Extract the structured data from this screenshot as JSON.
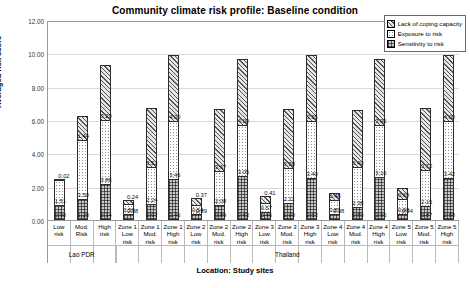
{
  "chart_data": {
    "type": "bar",
    "stacked": true,
    "title": "Community climate risk profile: Baseline condition",
    "xlabel": "Location: Study sites",
    "ylabel": "Averaged risk score",
    "ylim": [
      0,
      12
    ],
    "yticks": [
      "0.00",
      "2.00",
      "4.00",
      "6.00",
      "8.00",
      "10.00",
      "12.00"
    ],
    "ytick_values": [
      0,
      2,
      4,
      6,
      8,
      10,
      12
    ],
    "grid": true,
    "legend_position": "top-right",
    "legend": [
      {
        "label": "Lack of coping capacity",
        "pattern": "diagonal-hatch"
      },
      {
        "label": "Exposure to risk",
        "pattern": "light-dots"
      },
      {
        "label": "Sensitivity to risk",
        "pattern": "dark-checker"
      }
    ],
    "categories": [
      {
        "zone": "",
        "risk": "Low risk",
        "country": "Lao PDR"
      },
      {
        "zone": "",
        "risk": "Mod. Risk",
        "country": "Lao PDR"
      },
      {
        "zone": "",
        "risk": "High risk",
        "country": "Lao PDR"
      },
      {
        "zone": "Zone 1",
        "risk": "Low risk",
        "country": "Thailand"
      },
      {
        "zone": "Zone 1",
        "risk": "Mod. risk",
        "country": "Thailand"
      },
      {
        "zone": "Zone 1",
        "risk": "High risk",
        "country": "Thailand"
      },
      {
        "zone": "Zone 2",
        "risk": "Low risk",
        "country": "Thailand"
      },
      {
        "zone": "Zone 2",
        "risk": "Mod. risk",
        "country": "Thailand"
      },
      {
        "zone": "Zone 2",
        "risk": "High risk",
        "country": "Thailand"
      },
      {
        "zone": "Zone 3",
        "risk": "Low risk",
        "country": "Thailand"
      },
      {
        "zone": "Zone 3",
        "risk": "Mod. risk",
        "country": "Thailand"
      },
      {
        "zone": "Zone 3",
        "risk": "High risk",
        "country": "Thailand"
      },
      {
        "zone": "Zone 4",
        "risk": "Low risk",
        "country": "Thailand"
      },
      {
        "zone": "Zone 4",
        "risk": "Mod. risk",
        "country": "Thailand"
      },
      {
        "zone": "Zone 4",
        "risk": "High risk",
        "country": "Thailand"
      },
      {
        "zone": "Zone 5",
        "risk": "Low risk",
        "country": "Thailand"
      },
      {
        "zone": "Zone 5",
        "risk": "Mod. risk",
        "country": "Thailand"
      },
      {
        "zone": "Zone 5",
        "risk": "High risk",
        "country": "Thailand"
      }
    ],
    "series": [
      {
        "name": "Sensitivity to risk",
        "pattern": "dark-checker",
        "values": [
          0.9,
          1.28,
          2.14,
          0.38,
          0.97,
          2.46,
          0.39,
          0.89,
          2.63,
          0.46,
          1.0,
          2.53,
          0.38,
          0.8,
          2.56,
          0.34,
          0.87,
          2.5
        ]
      },
      {
        "name": "Exposure to risk",
        "pattern": "light-dots",
        "values": [
          1.51,
          3.5,
          3.86,
          0.56,
          2.24,
          3.46,
          0.54,
          2.08,
          3.05,
          0.57,
          2.11,
          3.4,
          0.81,
          2.38,
          3.16,
          0.9,
          2.15,
          3.42
        ]
      },
      {
        "name": "Lack of coping capacity",
        "pattern": "diagonal-hatch",
        "values": [
          0.02,
          1.44,
          3.29,
          0.24,
          3.53,
          4.0,
          0.37,
          3.67,
          4.0,
          0.41,
          3.58,
          3.95,
          0.46,
          3.4,
          3.96,
          0.69,
          3.72,
          4.0
        ]
      }
    ],
    "labels": {
      "sensitivity": [
        "0.90",
        "1.28",
        "2.14",
        "0.38",
        "0.97",
        "2.46",
        "0.39",
        "0.89",
        "2.63",
        "0.46",
        "1.00",
        "2.53",
        "0.38",
        "0.80",
        "2.56",
        "0.34",
        "0.87",
        "2.50"
      ],
      "exposure": [
        "1.51",
        "3.50",
        "3.86",
        "0.56",
        "2.24",
        "3.46",
        "0.54",
        "2.08",
        "3.05",
        "0.57",
        "2.11",
        "3.40",
        "0.81",
        "2.38",
        "3.16",
        "0.90",
        "2.15",
        "3.42"
      ],
      "coping": [
        "0.02",
        "1.44",
        "3.29",
        "0.24",
        "3.53",
        "4.00",
        "0.37",
        "3.67",
        "4.00",
        "0.41",
        "3.58",
        "3.95",
        "0.46",
        "3.40",
        "3.96",
        "0.69",
        "3.72",
        "4.00"
      ]
    },
    "country_bands": [
      {
        "label": "Lao PDR",
        "span": 3
      },
      {
        "label": "Thailand",
        "span": 15
      }
    ]
  }
}
